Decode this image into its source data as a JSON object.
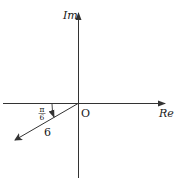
{
  "diagram": {
    "type": "complex-plane",
    "axes": {
      "real_label": "Re",
      "imag_label": "Im",
      "origin_label": "O"
    },
    "vector": {
      "magnitude_label": "6",
      "angle_numerator": "π",
      "angle_denominator": "6",
      "angle_description": "π/6 below negative real axis",
      "magnitude": 6,
      "angle_from_negative_real_axis_rad": "π/6"
    },
    "colors": {
      "stroke": "#333333",
      "text": "#1a1a1a"
    }
  }
}
